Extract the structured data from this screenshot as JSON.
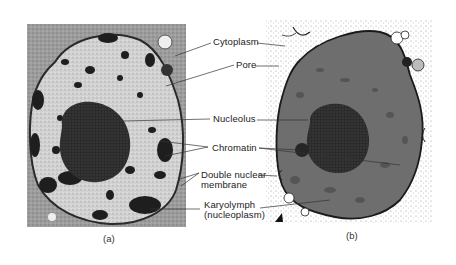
{
  "figure": {
    "panels": [
      {
        "id": "a",
        "caption": "(a)",
        "kind": "electron micrograph of cell nucleus"
      },
      {
        "id": "b",
        "caption": "(b)",
        "kind": "illustration of cell nucleus"
      }
    ],
    "labels": {
      "cytoplasm": "Cytoplasm",
      "pore": "Pore",
      "nucleolus": "Nucleolus",
      "chromatin": "Chromatin",
      "double_nuclear_line1": "Double nuclear",
      "double_nuclear_line2": "membrane",
      "karyolymph_line1": "Karyolymph",
      "karyolymph_line2": "(nucleoplasm)"
    },
    "colors": {
      "background": "#ffffff",
      "micrograph_gray": "#a8a8a8",
      "nucleus_fill_b": "#6e6e6e",
      "dark_chromatin": "#1e1e1e",
      "label_text": "#222222"
    }
  }
}
